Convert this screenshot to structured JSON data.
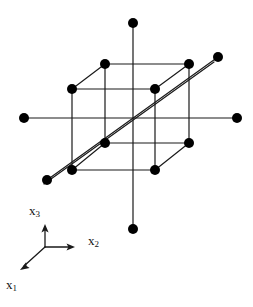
{
  "figure": {
    "stroke_color": "#1a1a1a",
    "dot_color": "#000000",
    "background_color": "#ffffff",
    "line_width": 1.2,
    "dot_radius": 5.0,
    "canvas": {
      "width": 253,
      "height": 307
    }
  },
  "axes": {
    "origin": {
      "x": 45,
      "y": 247
    },
    "items": [
      {
        "name": "x3",
        "label": "x",
        "subscript": "3",
        "direction": "up",
        "tip": {
          "x": 45,
          "y": 225
        },
        "label_position": {
          "x": 29,
          "y": 203
        }
      },
      {
        "name": "x2",
        "label": "x",
        "subscript": "2",
        "direction": "right",
        "tip": {
          "x": 74,
          "y": 247
        },
        "label_position": {
          "x": 88,
          "y": 233
        }
      },
      {
        "name": "x1",
        "label": "x",
        "subscript": "1",
        "direction": "down-left",
        "tip": {
          "x": 21,
          "y": 269
        },
        "label_position": {
          "x": 6,
          "y": 277
        }
      }
    ]
  },
  "lattice": {
    "cube_vertices": [
      {
        "id": "top-back-left",
        "x": 105,
        "y": 64
      },
      {
        "id": "top-back-right",
        "x": 189,
        "y": 64
      },
      {
        "id": "top-front-left",
        "x": 72,
        "y": 89
      },
      {
        "id": "top-front-right",
        "x": 155,
        "y": 89
      },
      {
        "id": "bottom-back-left",
        "x": 105,
        "y": 143
      },
      {
        "id": "bottom-back-right",
        "x": 189,
        "y": 143
      },
      {
        "id": "bottom-front-left",
        "x": 72,
        "y": 170
      },
      {
        "id": "bottom-front-right",
        "x": 155,
        "y": 170
      }
    ],
    "axis_end_points": [
      {
        "id": "x3-positive-end",
        "x": 133,
        "y": 23
      },
      {
        "id": "x3-negative-end",
        "x": 133,
        "y": 229
      },
      {
        "id": "x2-negative-end",
        "x": 24,
        "y": 118
      },
      {
        "id": "x2-positive-end",
        "x": 237,
        "y": 118
      },
      {
        "id": "diagonal-upper-end",
        "x": 218,
        "y": 57
      },
      {
        "id": "diagonal-lower-end",
        "x": 47,
        "y": 180
      }
    ],
    "cube_edges": [
      [
        "top-back-left",
        "top-back-right"
      ],
      [
        "top-front-left",
        "top-front-right"
      ],
      [
        "top-back-left",
        "top-front-left"
      ],
      [
        "top-back-right",
        "top-front-right"
      ],
      [
        "bottom-back-left",
        "bottom-back-right"
      ],
      [
        "bottom-front-left",
        "bottom-front-right"
      ],
      [
        "bottom-back-left",
        "bottom-front-left"
      ],
      [
        "bottom-back-right",
        "bottom-front-right"
      ],
      [
        "top-back-left",
        "bottom-back-left"
      ],
      [
        "top-back-right",
        "bottom-back-right"
      ],
      [
        "top-front-left",
        "bottom-front-left"
      ],
      [
        "top-front-right",
        "bottom-front-right"
      ]
    ],
    "through_lines": [
      {
        "id": "vertical-axis-line",
        "from": {
          "x": 133,
          "y": 23
        },
        "to": {
          "x": 133,
          "y": 229
        }
      },
      {
        "id": "horizontal-axis-line",
        "from": {
          "x": 24,
          "y": 118
        },
        "to": {
          "x": 237,
          "y": 118
        }
      },
      {
        "id": "body-diagonal-line-a",
        "from": {
          "x": 218,
          "y": 57
        },
        "to": {
          "x": 47,
          "y": 180
        }
      },
      {
        "id": "body-diagonal-line-b",
        "from": {
          "x": 214,
          "y": 62
        },
        "to": {
          "x": 44,
          "y": 184
        }
      }
    ],
    "dot_count": 14
  }
}
